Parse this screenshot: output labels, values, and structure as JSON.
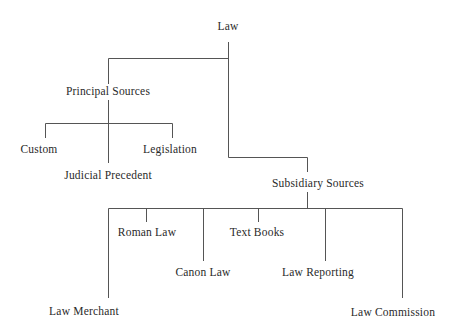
{
  "diagram": {
    "type": "tree",
    "colors": {
      "line": "#555555",
      "text": "#2a2a2a",
      "background": "#ffffff"
    },
    "nodes": {
      "root": {
        "label": "Law"
      },
      "principal": {
        "label": "Principal Sources"
      },
      "custom": {
        "label": "Custom"
      },
      "judicial_precedent": {
        "label": "Judicial Precedent"
      },
      "legislation": {
        "label": "Legislation"
      },
      "subsidiary": {
        "label": "Subsidiary Sources"
      },
      "law_merchant": {
        "label": "Law Merchant"
      },
      "roman_law": {
        "label": "Roman Law"
      },
      "canon_law": {
        "label": "Canon Law"
      },
      "text_books": {
        "label": "Text Books"
      },
      "law_reporting": {
        "label": "Law Reporting"
      },
      "law_commission": {
        "label": "Law Commission"
      }
    },
    "edges": [
      [
        "root",
        "principal"
      ],
      [
        "root",
        "subsidiary"
      ],
      [
        "principal",
        "custom"
      ],
      [
        "principal",
        "judicial_precedent"
      ],
      [
        "principal",
        "legislation"
      ],
      [
        "subsidiary",
        "law_merchant"
      ],
      [
        "subsidiary",
        "roman_law"
      ],
      [
        "subsidiary",
        "canon_law"
      ],
      [
        "subsidiary",
        "text_books"
      ],
      [
        "subsidiary",
        "law_reporting"
      ],
      [
        "subsidiary",
        "law_commission"
      ]
    ]
  }
}
